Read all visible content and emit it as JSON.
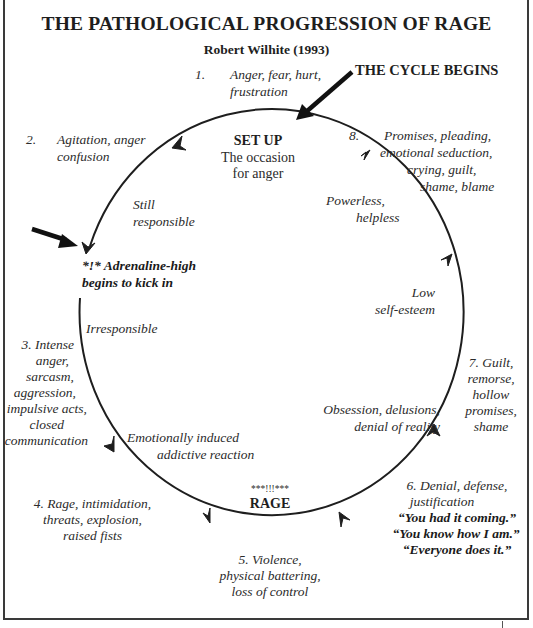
{
  "header": {
    "title": "THE PATHOLOGICAL PROGRESSION OF RAGE",
    "subtitle": "Robert Wilhite (1993)"
  },
  "callouts": {
    "cycle_begins": "THE CYCLE BEGINS",
    "adrenaline_line1": "*!* Adrenaline-high",
    "adrenaline_line2": "begins to kick in"
  },
  "center_labels": {
    "setup_title": "SET UP",
    "setup_line1": "The occasion",
    "setup_line2": "for anger",
    "rage_stars": "***!!!***",
    "rage_title": "RAGE"
  },
  "stages": [
    {
      "number": "1.",
      "lines": [
        "Anger, fear, hurt,",
        "frustration"
      ]
    },
    {
      "number": "2.",
      "lines": [
        "Agitation, anger",
        "confusion"
      ]
    },
    {
      "number": "3.",
      "lines": [
        "3. Intense",
        "anger,",
        "sarcasm,",
        "aggression,",
        "impulsive acts,",
        "closed",
        "communication"
      ]
    },
    {
      "number": "4.",
      "lines": [
        "4. Rage, intimidation,",
        "threats, explosion,",
        "raised fists"
      ]
    },
    {
      "number": "5.",
      "lines": [
        "5.  Violence,",
        "physical battering,",
        "loss of control"
      ]
    },
    {
      "number": "6.",
      "lines": [
        "6.  Denial, defense,",
        "justification"
      ],
      "quotes": [
        "“You had it coming.”",
        "“You know how I am.”",
        "“Everyone does it.”"
      ]
    },
    {
      "number": "7.",
      "lines": [
        "7. Guilt,",
        "remorse,",
        "hollow",
        "promises,",
        "shame"
      ]
    },
    {
      "number": "8.",
      "lines": [
        "Promises, pleading,",
        "emotional  seduction,",
        "crying, guilt,",
        "shame, blame"
      ]
    }
  ],
  "inner_labels": {
    "still_responsible": [
      "Still",
      "responsible"
    ],
    "irresponsible": "Irresponsible",
    "emotionally_induced": [
      "Emotionally induced",
      "addictive reaction"
    ],
    "obsession": [
      "Obsession, delusions,",
      "denial of reality"
    ],
    "low_self_esteem": [
      "Low",
      "self-esteem"
    ],
    "powerless": [
      "Powerless,",
      "helpless"
    ]
  },
  "colors": {
    "ink": "#1e1e1e",
    "text": "#2b2b2b",
    "background": "#ffffff",
    "frame": "#3a3a3a"
  }
}
